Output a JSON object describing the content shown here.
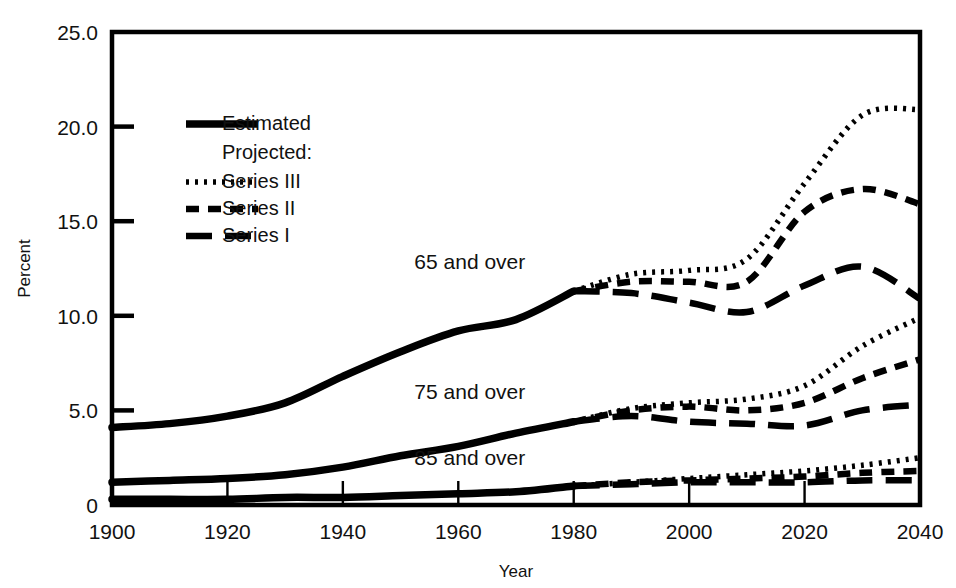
{
  "chart_data": {
    "type": "line",
    "title": "",
    "xlabel": "Year",
    "ylabel": "Percent",
    "xlim": [
      1900,
      2040
    ],
    "ylim": [
      0,
      25
    ],
    "grid": false,
    "legend_position": "upper-left-inside",
    "x_ticks": [
      "1900",
      "1920",
      "1940",
      "1960",
      "1980",
      "2000",
      "2020",
      "2040"
    ],
    "y_ticks": [
      "0",
      "5.0",
      "10.0",
      "15.0",
      "20.0",
      "25.0"
    ],
    "legend": {
      "estimated_label": "Estimated",
      "projected_label": "Projected:",
      "entries": [
        {
          "label": "Series III",
          "style": "dotted"
        },
        {
          "label": "Series II",
          "style": "dashed"
        },
        {
          "label": "Series I",
          "style": "long-dashed"
        }
      ]
    },
    "annotations": [
      {
        "text": "65 and over",
        "x": 1962,
        "y": 12.5
      },
      {
        "text": "75 and over",
        "x": 1962,
        "y": 5.6
      },
      {
        "text": "85 and over",
        "x": 1962,
        "y": 2.1
      }
    ],
    "groups": [
      {
        "name": "65 and over",
        "estimated": {
          "style": "solid",
          "x": [
            1900,
            1910,
            1920,
            1930,
            1940,
            1950,
            1960,
            1970,
            1980
          ],
          "values": [
            4.1,
            4.3,
            4.7,
            5.4,
            6.8,
            8.1,
            9.2,
            9.8,
            11.3
          ]
        },
        "projected": [
          {
            "name": "Series III",
            "style": "dotted",
            "x": [
              1980,
              1990,
              2000,
              2010,
              2020,
              2030,
              2040
            ],
            "values": [
              11.3,
              12.2,
              12.4,
              13.0,
              17.0,
              20.6,
              20.9
            ]
          },
          {
            "name": "Series II",
            "style": "dashed",
            "x": [
              1980,
              1990,
              2000,
              2010,
              2020,
              2030,
              2040
            ],
            "values": [
              11.3,
              11.8,
              11.8,
              11.8,
              15.5,
              16.7,
              15.9
            ]
          },
          {
            "name": "Series I",
            "style": "long-dashed",
            "x": [
              1980,
              1990,
              2000,
              2010,
              2020,
              2030,
              2040
            ],
            "values": [
              11.3,
              11.2,
              10.7,
              10.2,
              11.6,
              12.6,
              10.9
            ]
          }
        ]
      },
      {
        "name": "75 and over",
        "estimated": {
          "style": "solid",
          "x": [
            1900,
            1910,
            1920,
            1930,
            1940,
            1950,
            1960,
            1970,
            1980
          ],
          "values": [
            1.2,
            1.3,
            1.4,
            1.6,
            2.0,
            2.6,
            3.1,
            3.8,
            4.4
          ]
        },
        "projected": [
          {
            "name": "Series III",
            "style": "dotted",
            "x": [
              1980,
              1990,
              2000,
              2010,
              2020,
              2030,
              2040
            ],
            "values": [
              4.4,
              5.1,
              5.4,
              5.6,
              6.3,
              8.4,
              9.9
            ]
          },
          {
            "name": "Series II",
            "style": "dashed",
            "x": [
              1980,
              1990,
              2000,
              2010,
              2020,
              2030,
              2040
            ],
            "values": [
              4.4,
              5.0,
              5.2,
              5.0,
              5.4,
              6.7,
              7.7
            ]
          },
          {
            "name": "Series I",
            "style": "long-dashed",
            "x": [
              1980,
              1990,
              2000,
              2010,
              2020,
              2030,
              2040
            ],
            "values": [
              4.4,
              4.7,
              4.4,
              4.3,
              4.2,
              5.0,
              5.3
            ]
          }
        ]
      },
      {
        "name": "85 and over",
        "estimated": {
          "style": "solid",
          "x": [
            1900,
            1910,
            1920,
            1930,
            1940,
            1950,
            1960,
            1970,
            1980
          ],
          "values": [
            0.3,
            0.3,
            0.3,
            0.4,
            0.4,
            0.5,
            0.6,
            0.7,
            1.0
          ]
        },
        "projected": [
          {
            "name": "Series III",
            "style": "dotted",
            "x": [
              1980,
              1990,
              2000,
              2010,
              2020,
              2030,
              2040
            ],
            "values": [
              1.0,
              1.2,
              1.4,
              1.6,
              1.8,
              2.1,
              2.5
            ]
          },
          {
            "name": "Series II",
            "style": "dashed",
            "x": [
              1980,
              1990,
              2000,
              2010,
              2020,
              2030,
              2040
            ],
            "values": [
              1.0,
              1.2,
              1.3,
              1.4,
              1.5,
              1.7,
              1.8
            ]
          },
          {
            "name": "Series I",
            "style": "long-dashed",
            "x": [
              1980,
              1990,
              2000,
              2010,
              2020,
              2030,
              2040
            ],
            "values": [
              1.0,
              1.1,
              1.2,
              1.2,
              1.2,
              1.3,
              1.3
            ]
          }
        ]
      }
    ],
    "colors": {
      "line": "#000000",
      "axis": "#000000",
      "background": "#ffffff"
    }
  }
}
